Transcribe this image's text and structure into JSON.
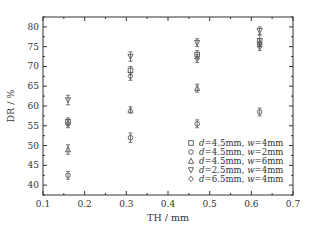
{
  "chart_data": {
    "type": "scatter",
    "title": "",
    "xlabel": "TH / mm",
    "ylabel": "DR / %",
    "xlim": [
      0.1,
      0.7
    ],
    "ylim": [
      37.5,
      82.5
    ],
    "xticks": [
      0.1,
      0.2,
      0.3,
      0.4,
      0.5,
      0.6,
      0.7
    ],
    "xtick_labels": [
      "0.1",
      "0.2",
      "0.3",
      "0.4",
      "0.5",
      "0.6",
      "0.7"
    ],
    "yticks": [
      40,
      45,
      50,
      55,
      60,
      65,
      70,
      75,
      80
    ],
    "ytick_labels": [
      "40",
      "45",
      "50",
      "55",
      "60",
      "65",
      "70",
      "75",
      "80"
    ],
    "grid": false,
    "error_bars": true,
    "legend_position": "lower right",
    "x": [
      0.16,
      0.31,
      0.47,
      0.62
    ],
    "series": [
      {
        "name": "d=4.5mm, w=4mm",
        "d": "d",
        "d_val": "=4.5mm,",
        "w": "w",
        "w_val": "=4mm",
        "marker": "square",
        "values": [
          56.0,
          69.0,
          73.0,
          76.5
        ],
        "err": [
          1.0,
          1.0,
          1.0,
          1.5
        ]
      },
      {
        "name": "d=4.5mm, w=2mm",
        "d": "d",
        "d_val": "=4.5mm,",
        "w": "w",
        "w_val": "=2mm",
        "marker": "circle",
        "values": [
          42.5,
          52.0,
          55.5,
          58.5
        ],
        "err": [
          1.0,
          1.2,
          1.0,
          1.0
        ]
      },
      {
        "name": "d=4.5mm, w=6mm",
        "d": "d",
        "d_val": "=4.5mm,",
        "w": "w",
        "w_val": "=6mm",
        "marker": "triangle-up",
        "values": [
          49.0,
          59.0,
          64.5,
          76.0
        ],
        "err": [
          1.2,
          0.8,
          1.0,
          1.0
        ]
      },
      {
        "name": "d=2.5mm, w=4mm",
        "d": "d",
        "d_val": "=2.5mm,",
        "w": "w",
        "w_val": "=4mm",
        "marker": "triangle-down",
        "values": [
          61.5,
          72.5,
          76.0,
          79.0
        ],
        "err": [
          1.2,
          1.2,
          1.0,
          1.0
        ]
      },
      {
        "name": "d=6.5mm, w=4mm",
        "d": "d",
        "d_val": "=6.5mm,",
        "w": "w",
        "w_val": "=4mm",
        "marker": "diamond",
        "values": [
          55.5,
          67.5,
          72.0,
          75.0
        ],
        "err": [
          1.0,
          1.0,
          1.0,
          1.0
        ]
      }
    ]
  },
  "colors": {
    "axis": "#333333",
    "marker": "#555555",
    "background": "#ffffff"
  }
}
